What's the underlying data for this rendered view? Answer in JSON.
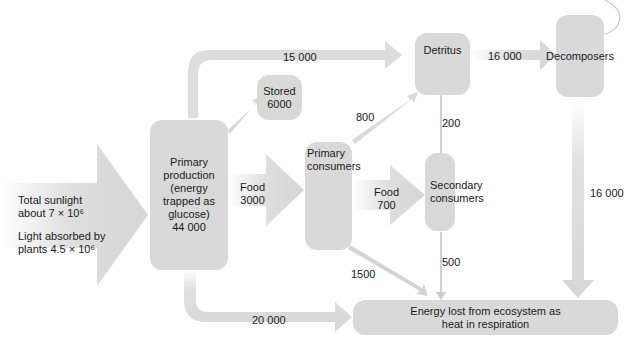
{
  "colors": {
    "box_fill": "#d9d9d9",
    "arrow_fill": "#dcdcdc",
    "text": "#1a1a1a"
  },
  "nodes": {
    "sunlight": {
      "line1": "Total sunlight",
      "line2": "about 7 × 10⁶",
      "line3": "Light absorbed by",
      "line4": "plants 4.5 × 10⁶"
    },
    "primary_production": "Primary\nproduction\n(energy\ntrapped as\nglucose)\n44 000",
    "stored": "Stored\n6000",
    "detritus": "Detritus",
    "decomposers": "Decomposers",
    "primary_consumers": "Primary\nconsumers",
    "secondary_consumers": "Secondary\nconsumers",
    "energy_lost": "Energy lost from ecosystem as\nheat in respiration"
  },
  "flows": {
    "production_to_detritus": "15 000",
    "detritus_to_decomposers": "16 000",
    "primary_consumers_to_detritus": "800",
    "secondary_to_detritus": "200",
    "food_to_primary": "Food\n3000",
    "food_to_secondary": "Food\n700",
    "decomposers_to_lost": "16 000",
    "primary_consumers_to_lost": "1500",
    "secondary_to_lost": "500",
    "production_to_lost": "20 000"
  }
}
